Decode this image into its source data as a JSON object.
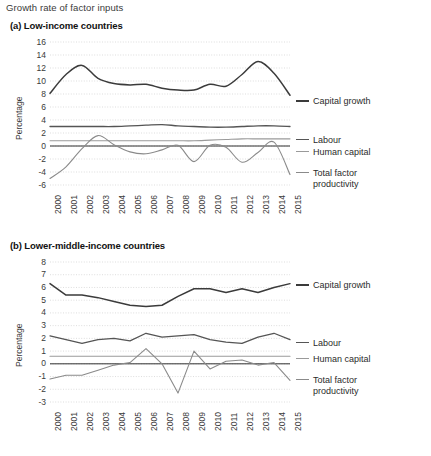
{
  "figure": {
    "title": "Growth rate of factor inputs"
  },
  "colors": {
    "capital": "#3b3b3b",
    "labour": "#555555",
    "human_capital": "#9a9a9a",
    "tfp": "#8a8a8a",
    "grid": "#cfcfcf",
    "zero_line": "#1a1a1a",
    "text": "#2b2b2b"
  },
  "panels": [
    {
      "id": "panel-a",
      "title": "(a) Low-income countries",
      "ylabel": "Percentage",
      "yticks": [
        16,
        14,
        12,
        10,
        8,
        6,
        4,
        2,
        0,
        -2,
        -4,
        -6
      ],
      "ylim": [
        -6,
        16
      ],
      "xticks": [
        "2000",
        "2001",
        "2002",
        "2003",
        "2004",
        "2005",
        "2006",
        "2007",
        "2008",
        "2009",
        "2010",
        "2011",
        "2012",
        "2013",
        "2014",
        "2015"
      ],
      "legend": [
        {
          "label": "Capital growth",
          "color": "#3b3b3b"
        },
        {
          "label": "Labour",
          "color": "#555555"
        },
        {
          "label": "Human capital",
          "color": "#9a9a9a"
        },
        {
          "label": "Total factor\nproductivity",
          "color": "#8a8a8a"
        }
      ]
    },
    {
      "id": "panel-b",
      "title": "(b) Lower-middle-income countries",
      "ylabel": "Percentage",
      "yticks": [
        8,
        7,
        6,
        5,
        4,
        3,
        2,
        1,
        0,
        -1,
        -2,
        -3
      ],
      "ylim": [
        -3,
        8
      ],
      "xticks": [
        "2000",
        "2001",
        "2002",
        "2003",
        "2004",
        "2005",
        "2006",
        "2007",
        "2008",
        "2009",
        "2010",
        "2011",
        "2012",
        "2013",
        "2014",
        "2015"
      ],
      "legend": [
        {
          "label": "Capital growth",
          "color": "#3b3b3b"
        },
        {
          "label": "Labour",
          "color": "#555555"
        },
        {
          "label": "Human capital",
          "color": "#9a9a9a"
        },
        {
          "label": "Total factor\nproductivity",
          "color": "#8a8a8a"
        }
      ]
    }
  ],
  "chart_data": [
    {
      "type": "line",
      "title": "(a) Low-income countries",
      "xlabel": "",
      "ylabel": "Percentage",
      "ylim": [
        -6,
        16
      ],
      "grid": true,
      "legend_position": "right",
      "x": [
        "2000",
        "2001",
        "2002",
        "2003",
        "2004",
        "2005",
        "2006",
        "2007",
        "2008",
        "2009",
        "2010",
        "2011",
        "2012",
        "2013",
        "2014",
        "2015"
      ],
      "series": [
        {
          "name": "Capital growth",
          "color": "#3b3b3b",
          "values": [
            8.1,
            11.0,
            12.4,
            10.4,
            9.6,
            9.4,
            9.5,
            8.9,
            8.6,
            8.6,
            9.5,
            9.2,
            11.0,
            13.0,
            11.2,
            7.8
          ]
        },
        {
          "name": "Labour",
          "color": "#555555",
          "values": [
            3.0,
            3.0,
            3.0,
            3.0,
            3.0,
            3.1,
            3.2,
            3.3,
            3.1,
            3.0,
            2.9,
            2.9,
            3.0,
            3.1,
            3.1,
            3.0
          ]
        },
        {
          "name": "Human capital",
          "color": "#9a9a9a",
          "values": [
            0.8,
            0.8,
            0.8,
            0.8,
            0.8,
            0.8,
            0.8,
            0.8,
            0.8,
            0.8,
            0.9,
            1.0,
            1.1,
            1.1,
            1.1,
            1.1
          ]
        },
        {
          "name": "Total factor productivity",
          "color": "#8a8a8a",
          "values": [
            -5.0,
            -3.2,
            -0.4,
            1.6,
            0.2,
            -0.9,
            -1.2,
            -0.6,
            0.1,
            -2.4,
            0.1,
            -0.2,
            -2.5,
            -1.0,
            0.6,
            -4.4
          ]
        }
      ]
    },
    {
      "type": "line",
      "title": "(b) Lower-middle-income countries",
      "xlabel": "",
      "ylabel": "Percentage",
      "ylim": [
        -3,
        8
      ],
      "grid": true,
      "legend_position": "right",
      "x": [
        "2000",
        "2001",
        "2002",
        "2003",
        "2004",
        "2005",
        "2006",
        "2007",
        "2008",
        "2009",
        "2010",
        "2011",
        "2012",
        "2013",
        "2014",
        "2015"
      ],
      "series": [
        {
          "name": "Capital growth",
          "color": "#3b3b3b",
          "values": [
            6.3,
            5.4,
            5.4,
            5.2,
            4.9,
            4.6,
            4.5,
            4.6,
            5.3,
            5.9,
            5.9,
            5.6,
            5.9,
            5.6,
            6.0,
            6.3
          ]
        },
        {
          "name": "Labour",
          "color": "#555555",
          "values": [
            2.2,
            1.9,
            1.6,
            1.9,
            2.0,
            1.8,
            2.4,
            2.1,
            2.2,
            2.3,
            1.9,
            1.7,
            1.6,
            2.1,
            2.4,
            1.9
          ]
        },
        {
          "name": "Human capital",
          "color": "#9a9a9a",
          "values": [
            0.6,
            0.6,
            0.6,
            0.6,
            0.6,
            0.6,
            0.6,
            0.6,
            0.6,
            0.6,
            0.6,
            0.6,
            0.6,
            0.6,
            0.6,
            0.6
          ]
        },
        {
          "name": "Total factor productivity",
          "color": "#8a8a8a",
          "values": [
            -1.2,
            -0.9,
            -0.9,
            -0.5,
            -0.1,
            0.1,
            1.2,
            0.0,
            -2.3,
            1.0,
            -0.4,
            0.2,
            0.3,
            -0.1,
            0.1,
            -1.3
          ]
        }
      ]
    }
  ]
}
